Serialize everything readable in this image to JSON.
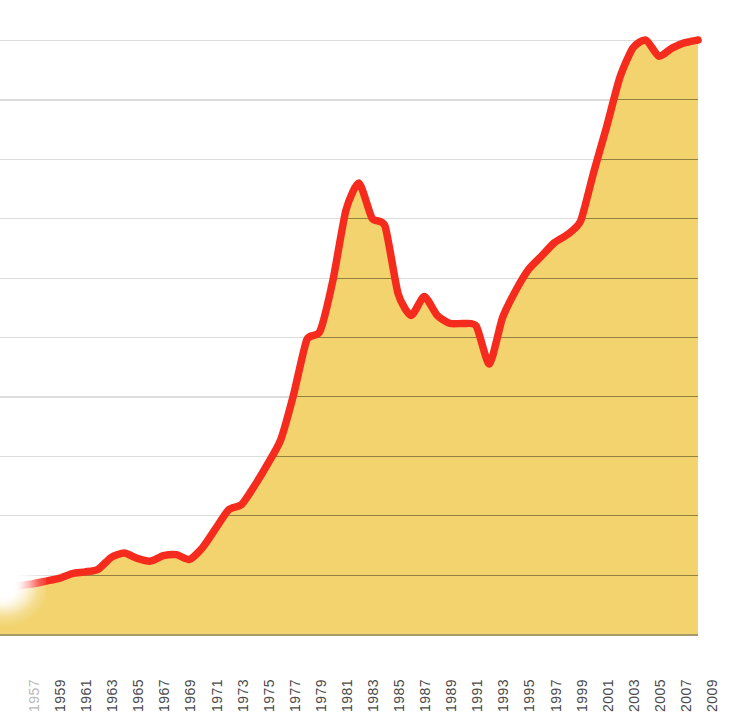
{
  "chart_data": {
    "type": "area",
    "title": "",
    "subtitle": "",
    "xlabel": "",
    "ylabel": "",
    "grid": true,
    "legend": false,
    "legend_position": "none",
    "xlim": [
      1957,
      2009
    ],
    "ylim": [
      0,
      11
    ],
    "y_gridline_count": 11,
    "y_axis_labels_shown": false,
    "line_color": "#F52B1E",
    "fill_color": "#F2D36E",
    "gridline_color_over_white": "#DCDCDC",
    "gridline_color_over_fill": "#8C7C3C",
    "baseline_color": "#A89B6A",
    "background_color": "#FFFFFF",
    "tick_label_color": "#4A4A4A",
    "x_tick_labels": [
      "1957",
      "1959",
      "1961",
      "1963",
      "1965",
      "1967",
      "1969",
      "1971",
      "1973",
      "1975",
      "1977",
      "1979",
      "1981",
      "1983",
      "1985",
      "1987",
      "1989",
      "1991",
      "1993",
      "1995",
      "1997",
      "1999",
      "2001",
      "2003",
      "2005",
      "2007",
      "2009"
    ],
    "x": [
      1957,
      1958,
      1959,
      1960,
      1961,
      1962,
      1963,
      1964,
      1965,
      1966,
      1967,
      1968,
      1969,
      1970,
      1971,
      1972,
      1973,
      1974,
      1975,
      1976,
      1977,
      1978,
      1979,
      1980,
      1981,
      1982,
      1983,
      1984,
      1985,
      1986,
      1987,
      1988,
      1989,
      1990,
      1991,
      1992,
      1993,
      1994,
      1995,
      1996,
      1997,
      1998,
      1999,
      2000,
      2001,
      2002,
      2003,
      2004,
      2005,
      2006,
      2007,
      2008,
      2009
    ],
    "values": [
      0.9,
      0.93,
      0.98,
      1.03,
      1.12,
      1.15,
      1.2,
      1.42,
      1.5,
      1.4,
      1.35,
      1.45,
      1.47,
      1.38,
      1.6,
      1.95,
      2.3,
      2.4,
      2.75,
      3.15,
      3.6,
      4.45,
      5.45,
      5.6,
      6.55,
      7.85,
      8.35,
      7.7,
      7.55,
      6.3,
      5.9,
      6.25,
      5.9,
      5.75,
      5.75,
      5.7,
      5.0,
      5.85,
      6.35,
      6.75,
      7.0,
      7.25,
      7.4,
      7.65,
      8.55,
      9.4,
      10.3,
      10.85,
      11.0,
      10.7,
      10.85,
      10.95,
      11.0
    ],
    "series": [
      {
        "name": "value",
        "values": [
          0.9,
          0.93,
          0.98,
          1.03,
          1.12,
          1.15,
          1.2,
          1.42,
          1.5,
          1.4,
          1.35,
          1.45,
          1.47,
          1.38,
          1.6,
          1.95,
          2.3,
          2.4,
          2.75,
          3.15,
          3.6,
          4.45,
          5.45,
          5.6,
          6.55,
          7.85,
          8.35,
          7.7,
          7.55,
          6.3,
          5.9,
          6.25,
          5.9,
          5.75,
          5.75,
          5.7,
          5.0,
          5.85,
          6.35,
          6.75,
          7.0,
          7.25,
          7.4,
          7.65,
          8.55,
          9.4,
          10.3,
          10.85,
          11.0,
          10.7,
          10.85,
          10.95,
          11.0
        ]
      }
    ],
    "annotations": [
      "Left edge of plot is obscured by a white radial fade overlay",
      "Local peak near 1983; trough near 1993; highest values 2005-2009"
    ]
  }
}
